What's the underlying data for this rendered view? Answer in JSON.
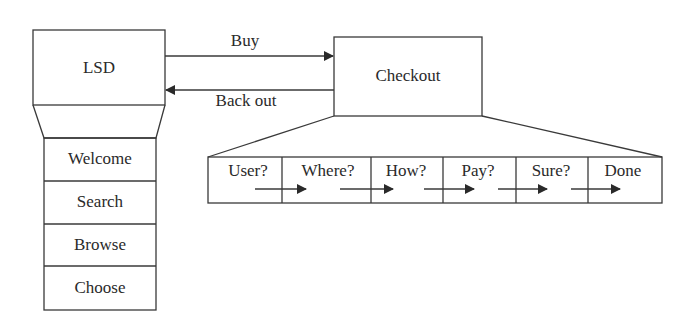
{
  "diagram": {
    "main_box": {
      "label": "LSD"
    },
    "menu_items": [
      {
        "label": "Welcome"
      },
      {
        "label": "Search"
      },
      {
        "label": "Browse"
      },
      {
        "label": "Choose"
      }
    ],
    "checkout_box": {
      "label": "Checkout"
    },
    "arrows": {
      "forward": {
        "label": "Buy"
      },
      "backward": {
        "label": "Back out"
      }
    },
    "checkout_steps": [
      {
        "label": "User?"
      },
      {
        "label": "Where?"
      },
      {
        "label": "How?"
      },
      {
        "label": "Pay?"
      },
      {
        "label": "Sure?"
      },
      {
        "label": "Done"
      }
    ],
    "colors": {
      "stroke": "#3a3a3a",
      "background": "#ffffff"
    }
  }
}
